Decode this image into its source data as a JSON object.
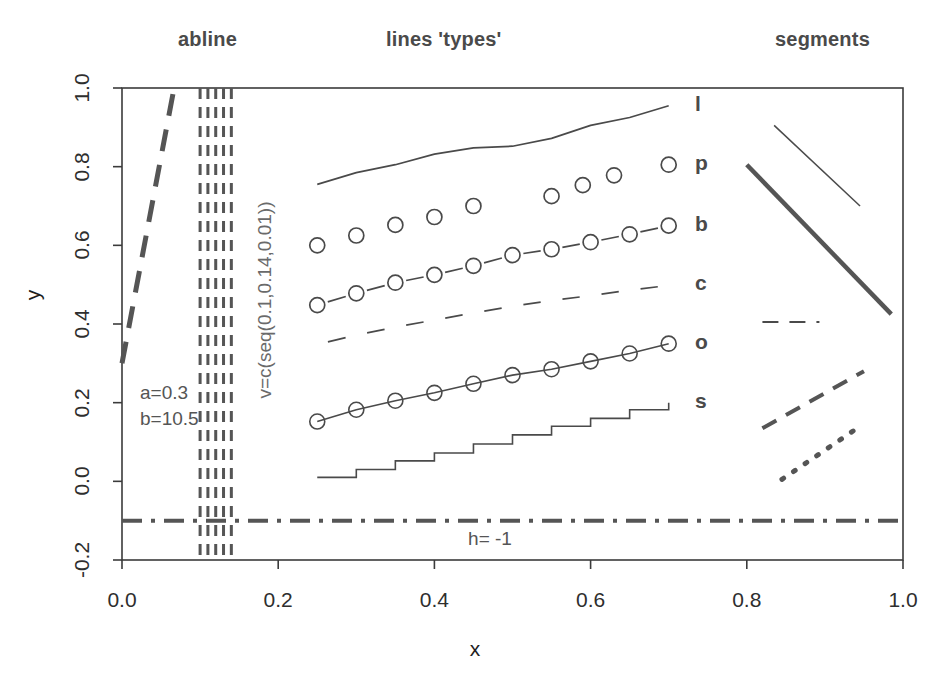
{
  "figure": {
    "panel_titles": [
      {
        "key": "abline",
        "label": "abline"
      },
      {
        "key": "types",
        "label": "lines 'types'"
      },
      {
        "key": "segments",
        "label": "segments"
      }
    ],
    "axis": {
      "x_title": "x",
      "y_title": "y",
      "x_ticks": [
        "0.0",
        "0.2",
        "0.4",
        "0.6",
        "0.8",
        "1.0"
      ],
      "y_ticks": [
        "1.0",
        "0.8",
        "0.6",
        "0.4",
        "0.2",
        "0.0",
        "-0.2"
      ]
    },
    "annotations": {
      "a": "a=0.3",
      "b": "b=10.5",
      "h": "h= -1",
      "v": "v=c(seq(0.1,0.14,0.01))"
    },
    "type_labels": [
      {
        "code": "l",
        "y": 0.955
      },
      {
        "code": "p",
        "y": 0.805
      },
      {
        "code": "b",
        "y": 0.65
      },
      {
        "code": "c",
        "y": 0.498
      },
      {
        "code": "o",
        "y": 0.35
      },
      {
        "code": "s",
        "y": 0.2
      }
    ],
    "colors": {
      "foreground": "#3b3b3b",
      "heavy": "#555555",
      "thin": "#4a4a4a",
      "background": "#ffffff"
    }
  },
  "chart_data": {
    "type": "line",
    "title": "",
    "xlabel": "x",
    "ylabel": "y",
    "xlim": [
      0.0,
      1.0
    ],
    "ylim": [
      -0.2,
      1.0
    ],
    "grid": false,
    "legend": "right-inside-labels",
    "x": [
      0.25,
      0.3,
      0.35,
      0.4,
      0.45,
      0.5,
      0.55,
      0.6,
      0.65,
      0.7
    ],
    "series": [
      {
        "name": "l",
        "plot_type": "line",
        "linetype": "solid",
        "label": "l",
        "x": [
          0.25,
          0.3,
          0.35,
          0.4,
          0.45,
          0.5,
          0.55,
          0.6,
          0.65,
          0.7
        ],
        "values": [
          0.755,
          0.785,
          0.805,
          0.832,
          0.848,
          0.852,
          0.872,
          0.905,
          0.925,
          0.955
        ]
      },
      {
        "name": "p",
        "plot_type": "points",
        "linetype": "none",
        "label": "p",
        "x": [
          0.25,
          0.3,
          0.35,
          0.4,
          0.45,
          0.55,
          0.59,
          0.63,
          0.7
        ],
        "values": [
          0.6,
          0.625,
          0.652,
          0.672,
          0.7,
          0.725,
          0.753,
          0.778,
          0.805
        ]
      },
      {
        "name": "b",
        "plot_type": "both",
        "linetype": "dashed-gapped",
        "label": "b",
        "x": [
          0.25,
          0.3,
          0.35,
          0.4,
          0.45,
          0.5,
          0.55,
          0.6,
          0.65,
          0.7
        ],
        "values": [
          0.448,
          0.478,
          0.505,
          0.525,
          0.548,
          0.575,
          0.59,
          0.608,
          0.628,
          0.65
        ]
      },
      {
        "name": "c",
        "plot_type": "lines-only-of-both",
        "linetype": "dash-gap",
        "label": "c",
        "x": [
          0.25,
          0.3,
          0.35,
          0.4,
          0.45,
          0.5,
          0.55,
          0.6,
          0.65,
          0.7
        ],
        "values": [
          0.348,
          0.372,
          0.392,
          0.41,
          0.428,
          0.445,
          0.46,
          0.472,
          0.486,
          0.498
        ]
      },
      {
        "name": "o",
        "plot_type": "overplotted",
        "linetype": "solid",
        "label": "o",
        "x": [
          0.25,
          0.3,
          0.35,
          0.4,
          0.45,
          0.5,
          0.55,
          0.6,
          0.65,
          0.7
        ],
        "values": [
          0.152,
          0.182,
          0.205,
          0.225,
          0.248,
          0.27,
          0.285,
          0.305,
          0.325,
          0.35
        ]
      },
      {
        "name": "s",
        "plot_type": "steps",
        "linetype": "solid",
        "label": "s",
        "x": [
          0.25,
          0.3,
          0.35,
          0.4,
          0.45,
          0.5,
          0.55,
          0.6,
          0.65,
          0.7
        ],
        "values": [
          0.01,
          0.03,
          0.052,
          0.072,
          0.095,
          0.118,
          0.14,
          0.16,
          0.182,
          0.2
        ]
      }
    ],
    "reference_lines": {
      "abline_diagonal": {
        "intercept": 0.3,
        "slope": 10.5,
        "linetype": "long-dash",
        "width": 5
      },
      "abline_h": {
        "y": -0.1,
        "label": "h= -1",
        "linetype": "dash-dot",
        "width": 4
      },
      "abline_v": {
        "x": [
          0.1,
          0.11,
          0.12,
          0.13,
          0.14
        ],
        "linetype": "dashed",
        "width": 3
      }
    },
    "segments": [
      {
        "name": "thin-descending",
        "x0": 0.835,
        "y0": 0.905,
        "x1": 0.945,
        "y1": 0.7,
        "style": "solid",
        "width": 1.5
      },
      {
        "name": "thick-descending",
        "x0": 0.8,
        "y0": 0.805,
        "x1": 0.985,
        "y1": 0.425,
        "style": "solid",
        "width": 4.5
      },
      {
        "name": "short-dashed-horizontal",
        "x0": 0.82,
        "y0": 0.405,
        "x1": 0.893,
        "y1": 0.405,
        "style": "dashed",
        "width": 2
      },
      {
        "name": "thick-dashed-ascending",
        "x0": 0.82,
        "y0": 0.135,
        "x1": 0.95,
        "y1": 0.28,
        "style": "dashed",
        "width": 4
      },
      {
        "name": "dotted-ascending",
        "x0": 0.845,
        "y0": 0.005,
        "x1": 0.945,
        "y1": 0.14,
        "style": "dotted",
        "width": 5
      }
    ]
  }
}
